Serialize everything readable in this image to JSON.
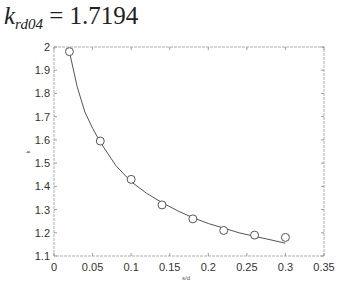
{
  "title": {
    "symbol": "k",
    "subscript": "rd04",
    "equals": " = ",
    "value": "1.7194"
  },
  "chart_data": {
    "type": "line",
    "xlabel": "s/d",
    "ylabel": "k",
    "xlim": [
      0,
      0.35
    ],
    "ylim": [
      1.1,
      2.0
    ],
    "grid": false,
    "legend": null,
    "xticks": [
      "0",
      "0.05",
      "0.1",
      "0.15",
      "0.2",
      "0.25",
      "0.3",
      "0.35"
    ],
    "yticks": [
      "1.1",
      "1.2",
      "1.3",
      "1.4",
      "1.5",
      "1.6",
      "1.7",
      "1.8",
      "1.9",
      "2"
    ],
    "series": [
      {
        "name": "measured",
        "style": "markers (open circles)",
        "x": [
          0.02,
          0.06,
          0.1,
          0.14,
          0.18,
          0.22,
          0.26,
          0.3
        ],
        "y": [
          1.98,
          1.595,
          1.43,
          1.32,
          1.26,
          1.21,
          1.19,
          1.18
        ]
      },
      {
        "name": "fitted curve",
        "style": "solid line",
        "x": [
          0.02,
          0.03,
          0.04,
          0.05,
          0.06,
          0.08,
          0.1,
          0.12,
          0.14,
          0.16,
          0.18,
          0.2,
          0.22,
          0.24,
          0.26,
          0.28,
          0.3
        ],
        "y": [
          1.98,
          1.83,
          1.72,
          1.65,
          1.59,
          1.49,
          1.42,
          1.37,
          1.33,
          1.295,
          1.265,
          1.24,
          1.22,
          1.2,
          1.185,
          1.17,
          1.155
        ]
      }
    ]
  }
}
